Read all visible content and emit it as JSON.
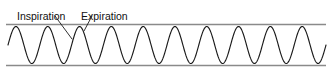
{
  "figure": {
    "kind": "respiratory-waveform-diagram",
    "width": 332,
    "height": 74,
    "background_color": "#ffffff"
  },
  "annotations": {
    "inspiration": {
      "label": "Inspiration",
      "x": 17,
      "y": 13,
      "leader": {
        "x1": 55,
        "y1": 16,
        "x2": 72,
        "y2": 39
      }
    },
    "expiration": {
      "label": "Expiration",
      "x": 81,
      "y": 13,
      "leader": {
        "x1": 92,
        "y1": 16,
        "x2": 84,
        "y2": 31
      }
    }
  },
  "rules": {
    "color": "#8a8a8a",
    "top": {
      "x1": 6,
      "y1": 24.5,
      "x2": 326,
      "y2": 24.5,
      "name": "upper-reference-line"
    },
    "bottom": {
      "x1": 6,
      "y1": 65.5,
      "x2": 326,
      "y2": 65.5,
      "name": "lower-reference-line"
    }
  },
  "chart_data": {
    "type": "line",
    "title": "",
    "xlabel": "",
    "ylabel": "",
    "grid": false,
    "legend_position": "none",
    "series_name": "respiration",
    "line_color": "#1a1a1a",
    "waveform": {
      "shape": "sinusoid",
      "cycles": 10,
      "period_px": 31.8,
      "amplitude_px": 18.5,
      "midline_y": 45,
      "peak_y": 26.5,
      "trough_y": 63.5,
      "x_start": 8,
      "x_end": 326,
      "phase_offset_px": 8
    },
    "peaks_x": [
      40,
      72,
      103,
      135,
      167,
      198,
      230,
      262,
      293,
      318
    ],
    "troughs_x": [
      24,
      56,
      88,
      119,
      151,
      183,
      214,
      246,
      278,
      309
    ],
    "xlim": [
      0,
      332
    ],
    "ylim": [
      24.5,
      65.5
    ]
  }
}
